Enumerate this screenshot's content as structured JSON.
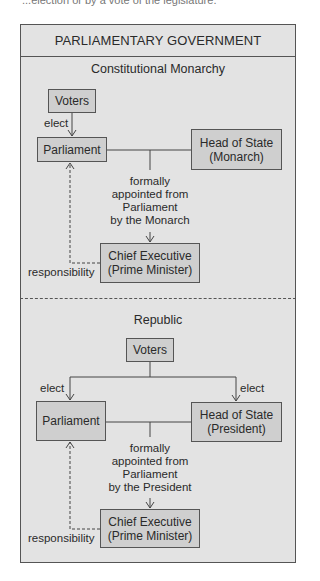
{
  "cut_off_caption": "...election or by a vote of the legislature.",
  "title": "PARLIAMENTARY GOVERNMENT",
  "colors": {
    "panel": "#e3e3e3",
    "box": "#cfcfcf",
    "line": "#555555"
  },
  "monarchy": {
    "heading": "Constitutional Monarchy",
    "voters": "Voters",
    "elect": "elect",
    "parliament": "Parliament",
    "head_of_state_1": "Head of State",
    "head_of_state_2": "(Monarch)",
    "appoint_1": "formally",
    "appoint_2": "appointed from",
    "appoint_3": "Parliament",
    "appoint_4": "by the Monarch",
    "chief_1": "Chief Executive",
    "chief_2": "(Prime Minister)",
    "responsibility": "responsibility"
  },
  "republic": {
    "heading": "Republic",
    "voters": "Voters",
    "elect_left": "elect",
    "elect_right": "elect",
    "parliament": "Parliament",
    "head_of_state_1": "Head of State",
    "head_of_state_2": "(President)",
    "appoint_1": "formally",
    "appoint_2": "appointed from",
    "appoint_3": "Parliament",
    "appoint_4": "by the President",
    "chief_1": "Chief Executive",
    "chief_2": "(Prime Minister)",
    "responsibility": "responsibility"
  }
}
